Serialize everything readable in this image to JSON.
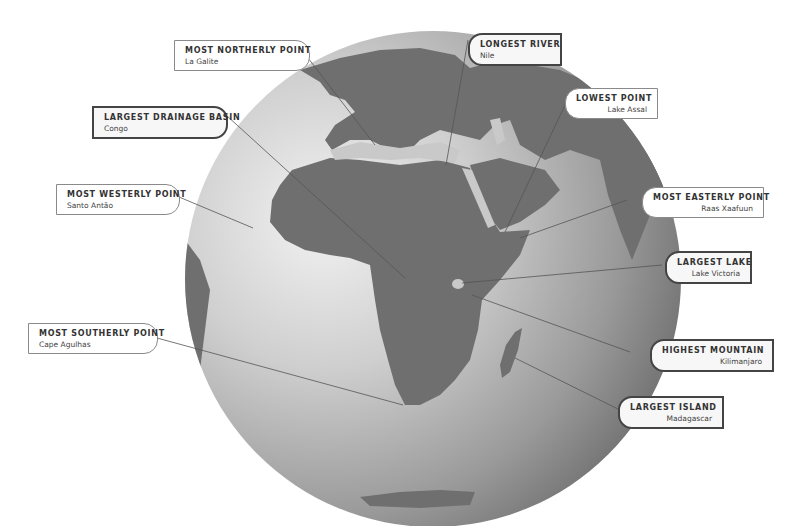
{
  "diagram": {
    "colors": {
      "land": "#6e6e6e",
      "ocean_light": "#e4e4e4",
      "ocean_dark": "#5a5a5a",
      "leader_line": "#555555"
    }
  },
  "callouts": {
    "most_northerly": {
      "title": "MOST NORTHERLY POINT",
      "value": "La Galite"
    },
    "longest_river": {
      "title": "LONGEST RIVER",
      "value": "Nile"
    },
    "lowest_point": {
      "title": "LOWEST POINT",
      "value": "Lake Assal"
    },
    "largest_drainage_basin": {
      "title": "LARGEST DRAINAGE BASIN",
      "value": "Congo"
    },
    "most_westerly": {
      "title": "MOST WESTERLY POINT",
      "value": "Santo Antão"
    },
    "most_easterly": {
      "title": "MOST EASTERLY POINT",
      "value": "Raas Xaafuun"
    },
    "largest_lake": {
      "title": "LARGEST LAKE",
      "value": "Lake Victoria"
    },
    "most_southerly": {
      "title": "MOST SOUTHERLY POINT",
      "value": "Cape Agulhas"
    },
    "highest_mountain": {
      "title": "HIGHEST MOUNTAIN",
      "value": "Kilimanjaro"
    },
    "largest_island": {
      "title": "LARGEST ISLAND",
      "value": "Madagascar"
    }
  }
}
